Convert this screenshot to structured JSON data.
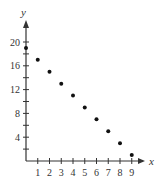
{
  "chart_data": {
    "type": "scatter",
    "title": "",
    "xlabel": "x",
    "ylabel": "y",
    "x": [
      0,
      1,
      2,
      3,
      4,
      5,
      6,
      7,
      8,
      9
    ],
    "y": [
      19,
      17,
      15,
      13,
      11,
      9,
      7,
      5,
      3,
      1
    ],
    "xticks": [
      1,
      2,
      3,
      4,
      5,
      6,
      7,
      8,
      9
    ],
    "yticks_labeled": [
      4,
      8,
      12,
      16,
      20
    ],
    "yticks_minor_step": 2,
    "xlim": [
      0,
      10
    ],
    "ylim": [
      0,
      22
    ],
    "grid": false,
    "legend": null
  },
  "colors": {
    "axis": "#333333",
    "points": "#111111",
    "text": "#333333"
  }
}
